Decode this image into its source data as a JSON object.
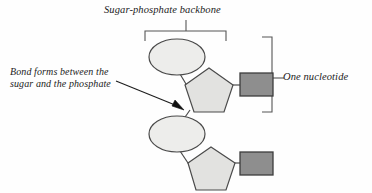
{
  "figure": {
    "kind": "biology-diagram",
    "background_color": "#fefefe",
    "stroke_color": "#3a3a3a",
    "text_color": "#1c1c1c"
  },
  "labels": {
    "backbone": "Sugar-phosphate backbone",
    "bond_line1": "Bond forms between the",
    "bond_line2": "sugar and the phosphate",
    "nucleotide": "One nucleotide"
  },
  "shapes": {
    "phosphate": {
      "name": "phosphate-ellipse",
      "fill": "#ededeb",
      "stroke": "#4a4a4a"
    },
    "sugar": {
      "name": "sugar-pentagon",
      "fill": "#e0e0de",
      "stroke": "#4a4a4a"
    },
    "base": {
      "name": "nitrogenous-base-rectangle",
      "fill": "#8e8e8e",
      "stroke": "#3d3d3d"
    }
  },
  "nucleotides": [
    {
      "id": "nucleotide-top",
      "phosphate": {
        "cx": 177,
        "cy": 57,
        "rx": 28,
        "ry": 18
      },
      "sugar": {
        "cx": 209,
        "cy": 91,
        "r": 25
      },
      "base": {
        "x": 233,
        "y": 73,
        "w": 37,
        "h": 23
      }
    },
    {
      "id": "nucleotide-bottom",
      "phosphate": {
        "cx": 177,
        "cy": 134,
        "rx": 28,
        "ry": 18
      },
      "sugar": {
        "cx": 211,
        "cy": 169,
        "r": 25
      },
      "base": {
        "x": 233,
        "y": 157,
        "w": 37,
        "h": 23
      }
    }
  ],
  "brackets": {
    "backbone_bracket": {
      "x1": 145,
      "x2": 226,
      "y": 31,
      "stem_x": 186,
      "stem_top": 20
    },
    "nucleotide_bracket": {
      "x": 272,
      "y1": 37,
      "y2": 112,
      "stem_y": 78,
      "stem_right": 283
    }
  },
  "arrow": {
    "name": "bond-pointer-arrow",
    "from_x": 115,
    "from_y": 81,
    "to_x": 184,
    "to_y": 110
  }
}
